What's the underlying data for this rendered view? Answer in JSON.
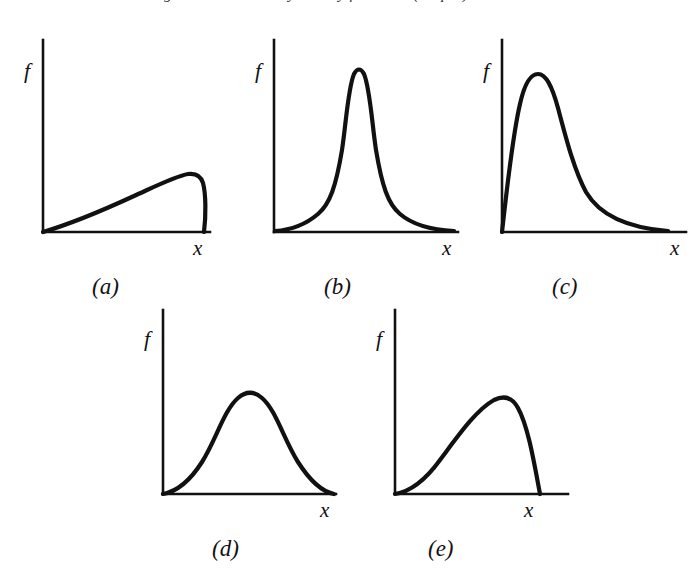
{
  "figure": {
    "top_cropped_caption": "Figure 4.4  Probability density functions (shapes)",
    "axis_labels": {
      "vertical": "f",
      "horizontal": "x"
    },
    "ink_color": "#111111",
    "background_color": "#ffffff"
  },
  "panels": [
    {
      "id": "a",
      "caption": "(a)",
      "shape_name": "slow-rise-abrupt-cutoff",
      "axis_label_y": "f",
      "axis_label_x": "x",
      "box": {
        "left": 30,
        "top": 28,
        "width": 200,
        "height": 212
      },
      "axes": {
        "origin_x": 13,
        "origin_y": 204,
        "y_top": 12,
        "x_right": 180
      },
      "curve_path": "M 13 204 C 40 196 78 180 104 168 C 126 158 146 148 158 146 C 166 145 171 148 173 155 C 176 166 176 188 174 204",
      "caption_pos": {
        "left": 62,
        "top": 247
      },
      "label_f_pos": {
        "left": 24,
        "top": 32
      },
      "label_x_pos": {
        "left": 193,
        "top": 229
      }
    },
    {
      "id": "b",
      "caption": "(b)",
      "shape_name": "sharp-symmetric-peak-heavy-tails",
      "axis_label_y": "f",
      "axis_label_x": "x",
      "box": {
        "left": 262,
        "top": 28,
        "width": 200,
        "height": 212
      },
      "axes": {
        "origin_x": 12,
        "origin_y": 204,
        "y_top": 12,
        "x_right": 196
      },
      "curve_path": "M 13 203 C 28 202 42 198 56 186 C 68 176 74 158 80 122 C 84 96 86 60 92 46 C 95 40 99 40 102 46 C 108 60 110 96 114 122 C 120 158 126 176 138 186 C 152 198 172 202 192 203",
      "caption_pos": {
        "left": 62,
        "top": 247
      },
      "label_f_pos": {
        "left": 0,
        "top": 32
      },
      "label_x_pos": {
        "left": 182,
        "top": 229
      }
    },
    {
      "id": "c",
      "caption": "(c)",
      "shape_name": "right-skewed-long-tail",
      "axis_label_y": "f",
      "axis_label_x": "x",
      "box": {
        "left": 490,
        "top": 28,
        "width": 200,
        "height": 212
      },
      "axes": {
        "origin_x": 12,
        "origin_y": 204,
        "y_top": 12,
        "x_right": 196
      },
      "curve_path": "M 12 204 C 16 170 22 110 30 76 C 34 58 40 46 48 46 C 56 46 62 58 68 80 C 76 110 84 142 96 164 C 110 188 140 200 178 203",
      "caption_pos": {
        "left": 62,
        "top": 247
      },
      "label_f_pos": {
        "left": 0,
        "top": 32
      },
      "label_x_pos": {
        "left": 182,
        "top": 229
      }
    },
    {
      "id": "d",
      "caption": "(d)",
      "shape_name": "symmetric-bell",
      "axis_label_y": "f",
      "axis_label_x": "x",
      "box": {
        "left": 150,
        "top": 298,
        "width": 200,
        "height": 212
      },
      "axes": {
        "origin_x": 13,
        "origin_y": 196,
        "y_top": 12,
        "x_right": 186
      },
      "curve_path": "M 13 196 C 24 194 38 186 52 164 C 66 142 74 112 88 100 C 96 93 104 93 112 100 C 126 112 134 142 148 164 C 162 186 174 194 184 196",
      "caption_pos": {
        "left": 62,
        "top": 239
      },
      "label_f_pos": {
        "left": 0,
        "top": 30
      },
      "label_x_pos": {
        "left": 176,
        "top": 221
      }
    },
    {
      "id": "e",
      "caption": "(e)",
      "shape_name": "left-skewed-steep-fall",
      "axis_label_y": "f",
      "axis_label_x": "x",
      "box": {
        "left": 382,
        "top": 298,
        "width": 200,
        "height": 212
      },
      "axes": {
        "origin_x": 13,
        "origin_y": 196,
        "y_top": 12,
        "x_right": 186
      },
      "curve_path": "M 13 196 C 26 194 42 184 58 162 C 76 138 94 112 112 102 C 122 97 130 99 136 110 C 146 128 152 164 158 196",
      "caption_pos": {
        "left": 46,
        "top": 239
      },
      "label_f_pos": {
        "left": 0,
        "top": 30
      },
      "label_x_pos": {
        "left": 148,
        "top": 221
      }
    }
  ],
  "chart_data": {
    "type": "line",
    "xlabel": "x",
    "ylabel": "f",
    "grid": false,
    "legend": null,
    "axis_ranges": {
      "x": [
        0,
        1
      ],
      "y": [
        0,
        1
      ]
    },
    "panel_count": 5,
    "series": [
      {
        "name": "(a) slow rise with abrupt cutoff",
        "description": "Rises nearly linearly from the origin, flattens to a rounded maximum near the right end, then drops almost vertically back to the x-axis.",
        "x": [
          0.0,
          0.1,
          0.2,
          0.3,
          0.4,
          0.5,
          0.6,
          0.7,
          0.78,
          0.84,
          0.88,
          0.92,
          0.94,
          0.95
        ],
        "y": [
          0.0,
          0.055,
          0.11,
          0.165,
          0.22,
          0.265,
          0.3,
          0.325,
          0.34,
          0.345,
          0.335,
          0.24,
          0.1,
          0.0
        ],
        "peak_x": 0.84,
        "peak_y": 0.345
      },
      {
        "name": "(b) sharp symmetric peak with heavy tails",
        "description": "Near-zero at the left, rises steeply to a tall narrow symmetric peak at about 45% of the axis, then falls with long heavy tails approaching the axis.",
        "x": [
          0.0,
          0.08,
          0.16,
          0.24,
          0.3,
          0.36,
          0.4,
          0.43,
          0.455,
          0.48,
          0.52,
          0.56,
          0.62,
          0.7,
          0.8,
          0.9,
          1.0
        ],
        "y": [
          0.005,
          0.015,
          0.04,
          0.09,
          0.16,
          0.33,
          0.58,
          0.82,
          0.94,
          0.9,
          0.62,
          0.38,
          0.2,
          0.1,
          0.045,
          0.02,
          0.008
        ],
        "peak_x": 0.455,
        "peak_y": 0.94
      },
      {
        "name": "(c) right-skewed with long tail",
        "description": "Rises very steeply from the origin to a peak at roughly one quarter of the axis, then decays smoothly with a long right tail that merges into the axis.",
        "x": [
          0.0,
          0.04,
          0.09,
          0.14,
          0.19,
          0.24,
          0.28,
          0.34,
          0.42,
          0.5,
          0.6,
          0.7,
          0.82,
          0.92,
          1.0
        ],
        "y": [
          0.0,
          0.28,
          0.6,
          0.82,
          0.92,
          0.93,
          0.87,
          0.72,
          0.52,
          0.37,
          0.23,
          0.14,
          0.065,
          0.025,
          0.01
        ],
        "peak_x": 0.24,
        "peak_y": 0.93
      },
      {
        "name": "(d) symmetric bell",
        "description": "A broad symmetric bell-shaped curve; near zero at both ends, smooth rounded maximum at the middle of the axis.",
        "x": [
          0.0,
          0.08,
          0.16,
          0.24,
          0.32,
          0.4,
          0.46,
          0.5,
          0.54,
          0.6,
          0.68,
          0.76,
          0.84,
          0.92,
          1.0
        ],
        "y": [
          0.005,
          0.03,
          0.09,
          0.21,
          0.37,
          0.49,
          0.53,
          0.545,
          0.53,
          0.49,
          0.37,
          0.21,
          0.09,
          0.03,
          0.005
        ],
        "peak_x": 0.5,
        "peak_y": 0.545
      },
      {
        "name": "(e) left-skewed with steep fall",
        "description": "Rises gently and steadily from the origin to a rounded maximum at about 60% of the axis, then falls steeply back to the x-axis.",
        "x": [
          0.0,
          0.08,
          0.16,
          0.24,
          0.32,
          0.4,
          0.48,
          0.55,
          0.6,
          0.65,
          0.72,
          0.78,
          0.83,
          0.86
        ],
        "y": [
          0.005,
          0.03,
          0.09,
          0.17,
          0.27,
          0.37,
          0.46,
          0.515,
          0.53,
          0.52,
          0.44,
          0.31,
          0.15,
          0.0
        ],
        "peak_x": 0.6,
        "peak_y": 0.53
      }
    ]
  }
}
